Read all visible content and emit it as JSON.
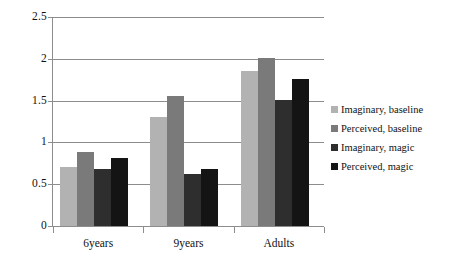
{
  "chart_data": {
    "type": "bar",
    "title": "",
    "xlabel": "",
    "ylabel": "",
    "ylim": [
      0,
      2.5
    ],
    "ytick_labels": [
      "2.5",
      "2",
      "1.5",
      "1",
      "0.5",
      "0"
    ],
    "ytick_values": [
      2.5,
      2,
      1.5,
      1,
      0.5,
      0
    ],
    "grid": "horizontal",
    "legend_position": "right",
    "categories": [
      "6years",
      "9years",
      "Adults"
    ],
    "series": [
      {
        "name": "Imaginary, baseline",
        "color": "#b2b2b2",
        "values": [
          0.7,
          1.3,
          1.86
        ]
      },
      {
        "name": "Perceived, baseline",
        "color": "#7a7a7a",
        "values": [
          0.89,
          1.55,
          2.01
        ]
      },
      {
        "name": "Imaginary, magic",
        "color": "#2e2e2e",
        "values": [
          0.68,
          0.62,
          1.51
        ]
      },
      {
        "name": "Perceived, magic",
        "color": "#141414",
        "values": [
          0.81,
          0.68,
          1.76
        ]
      }
    ]
  },
  "axes": {
    "gridline_color": "#8d8d8d",
    "axis_color": "#8d8d8d"
  }
}
